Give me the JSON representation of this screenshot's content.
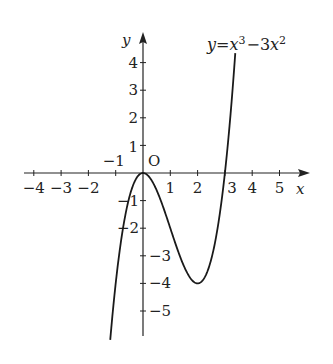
{
  "chart_data": {
    "type": "line",
    "title": "",
    "function_label": {
      "lhs": "y",
      "eq": "=",
      "t1": "x",
      "t1_exp": "3",
      "minus": "−",
      "t2_coef": "3",
      "t2": "x",
      "t2_exp": "2"
    },
    "equation": "y = x^3 - 3x^2",
    "xlabel": "x",
    "ylabel": "y",
    "origin_label": "O",
    "x_ticks": [
      -4,
      -3,
      -2,
      -1,
      1,
      2,
      3,
      4,
      5
    ],
    "x_tick_labels": [
      "−4",
      "−3",
      "−2",
      "−1",
      "1",
      "2",
      "3",
      "4",
      "5"
    ],
    "y_ticks": [
      4,
      3,
      2,
      1,
      -1,
      -2,
      -3,
      -4,
      -5
    ],
    "y_tick_labels": [
      "4",
      "3",
      "2",
      "1",
      "−1",
      "−2",
      "−3",
      "−4",
      "−5"
    ],
    "xlim": [
      -4.5,
      5.8
    ],
    "ylim": [
      -6.0,
      4.8
    ],
    "grid": false,
    "key_points": [
      {
        "x": 0,
        "y": 0,
        "note": "local max"
      },
      {
        "x": 2,
        "y": -4,
        "note": "local min"
      },
      {
        "x": 3,
        "y": 0,
        "note": "root"
      }
    ],
    "series": [
      {
        "name": "y = x^3 - 3x^2",
        "x_range": [
          -1.2,
          3.38
        ]
      }
    ]
  },
  "colors": {
    "curve": "#1a1a1a",
    "axis": "#222222",
    "background": "#ffffff"
  }
}
